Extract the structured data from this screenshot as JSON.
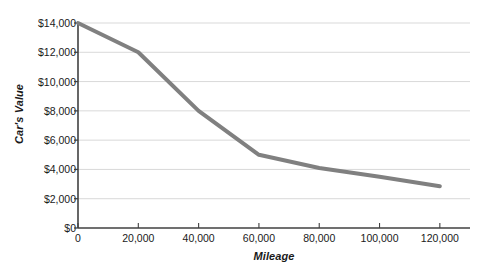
{
  "chart_data": {
    "type": "line",
    "title": "",
    "xlabel": "Mileage",
    "ylabel": "Car's Value",
    "x": [
      0,
      20000,
      40000,
      60000,
      80000,
      100000,
      120000
    ],
    "values": [
      14000,
      12000,
      8000,
      5000,
      4100,
      3500,
      2850
    ],
    "series": [
      {
        "name": "Car's Value",
        "color": "#808080",
        "values": [
          14000,
          12000,
          8000,
          5000,
          4100,
          3500,
          2850
        ]
      }
    ],
    "xlim": [
      0,
      130000
    ],
    "ylim": [
      0,
      14000
    ],
    "y_ticks": [
      0,
      2000,
      4000,
      6000,
      8000,
      10000,
      12000,
      14000
    ],
    "y_tick_labels": [
      "$0",
      "$2,000",
      "$4,000",
      "$6,000",
      "$8,000",
      "$10,000",
      "$12,000",
      "$14,000"
    ],
    "x_ticks": [
      0,
      20000,
      40000,
      60000,
      80000,
      100000,
      120000
    ],
    "x_tick_labels": [
      "0",
      "20,000",
      "40,000",
      "60,000",
      "80,000",
      "100,000",
      "120,000"
    ],
    "grid": true,
    "grid_axis": "y",
    "grid_color": "#d9d9d9",
    "axis_color": "#404040",
    "legend": false,
    "legend_position": "none",
    "background": "#ffffff"
  }
}
